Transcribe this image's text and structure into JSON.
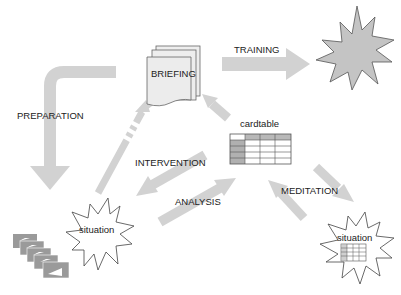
{
  "diagram": {
    "nodes": {
      "briefing": {
        "label": "BRIEFING",
        "shape": "document-stack"
      },
      "outcome": {
        "label": "",
        "shape": "starburst-filled"
      },
      "cardtable": {
        "label": "cardtable",
        "shape": "grid-table"
      },
      "situation_left": {
        "label": "situation",
        "shape": "starburst-outline"
      },
      "situation_right": {
        "label": "situation",
        "shape": "starburst-outline-with-table"
      },
      "cards": {
        "label": "",
        "shape": "stacked-cards"
      }
    },
    "edges": {
      "training": {
        "label": "TRAINING",
        "from": "briefing",
        "to": "outcome"
      },
      "preparation": {
        "label": "PREPARATION",
        "from": "briefing",
        "to": "situation_left"
      },
      "intervention": {
        "label": "INTERVENTION",
        "from": "cardtable",
        "to": "situation_left"
      },
      "analysis": {
        "label": "ANALYSIS",
        "from": "situation_left",
        "to": "cardtable"
      },
      "meditation": {
        "label": "MEDITATION",
        "from": "cardtable",
        "to": "situation_right"
      },
      "meditation_return": {
        "label": "",
        "from": "situation_right",
        "to": "cardtable"
      },
      "cardtable_to_briefing": {
        "label": "",
        "from": "cardtable",
        "to": "briefing"
      },
      "situation_to_briefing": {
        "label": "",
        "from": "situation_left",
        "to": "briefing",
        "style": "dashed"
      }
    },
    "colors": {
      "arrow": "#d0d0d0",
      "doc_fill": "#eeeeee",
      "star_fill": "#c4c4c4",
      "cell_dark": "#b0b0b0",
      "cards": "#9a9a9a",
      "stroke": "#555555"
    }
  }
}
